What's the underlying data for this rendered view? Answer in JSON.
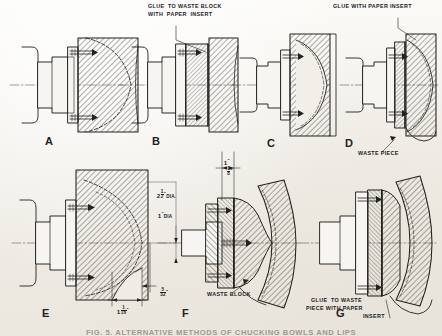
{
  "plate": {
    "title": "Alternative Methods of Chucking Bowls and Lips",
    "caption": "FIG. 5.  ALTERNATIVE METHODS OF CHUCKING BOWLS AND LIPS",
    "background_color": "#f4f2ee",
    "ink_color": "#23211e",
    "width": 442,
    "height": 336
  },
  "figures": [
    {
      "id": "A",
      "letter": "A",
      "caption": "Bowl blank screwed directly to faceplate"
    },
    {
      "id": "B",
      "letter": "B",
      "caption": "Blank glued to waste block with paper insert"
    },
    {
      "id": "C",
      "letter": "C",
      "caption": "Hollowed bowl on faceplate, waste at rim"
    },
    {
      "id": "D",
      "letter": "D",
      "caption": "Bowl glued with paper insert, waste piece at back"
    },
    {
      "id": "E",
      "letter": "E",
      "caption": "Deep bowl blank mounted on faceplate"
    },
    {
      "id": "F",
      "letter": "F",
      "caption": "Lip turned on waste block, dimensioned"
    },
    {
      "id": "G",
      "letter": "G",
      "caption": "Lip glued to waste piece with paper insert"
    }
  ],
  "annotations": [
    {
      "id": "glue-waste-block",
      "lines": [
        "GLUE  TO WASTE BLOCK",
        "WITH  PAPER  INSERT"
      ]
    },
    {
      "id": "glue-paper-insert",
      "lines": [
        "GLUE WITH PAPER INSERT"
      ]
    },
    {
      "id": "waste-piece",
      "lines": [
        "WASTE PIECE"
      ]
    },
    {
      "id": "waste-block",
      "lines": [
        "WASTE BLOCK"
      ]
    },
    {
      "id": "glue-waste-piece",
      "lines": [
        "GLUE  TO WASTE",
        "PIECE WITH PAPER",
        "INSERT"
      ]
    }
  ],
  "dimensions": [
    {
      "id": "dia-two-half",
      "whole": "2",
      "num": "1",
      "den": "2",
      "unit": "\"",
      "suffix": "DIA."
    },
    {
      "id": "dia-one",
      "whole": "1",
      "unit": "\"",
      "suffix": "DIA"
    },
    {
      "id": "len-five-thirtyseconds",
      "num": "5",
      "den": "32",
      "unit": "\""
    },
    {
      "id": "len-one-one-sixteenth",
      "whole": "1",
      "num": "1",
      "den": "16",
      "unit": "\""
    },
    {
      "id": "len-one-inch",
      "whole": "1",
      "unit": "\""
    },
    {
      "id": "len-one-eighth",
      "num": "1",
      "den": "8",
      "unit": "\""
    }
  ]
}
